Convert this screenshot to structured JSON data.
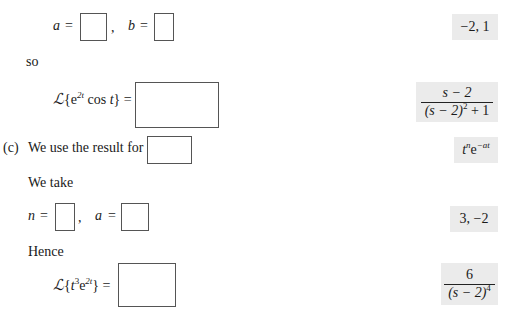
{
  "rows": {
    "ab": {
      "a_label": "a",
      "b_label": "b",
      "eq": "=",
      "comma": ",",
      "answer": "−2, 1"
    },
    "so": {
      "text": "so"
    },
    "laplace_cos": {
      "L": "ℒ",
      "open": "{e",
      "exp": "2t",
      "mid": " cos ",
      "t": "t",
      "close": "} =",
      "answer_num": "s − 2",
      "answer_den_base": "(s − 2)",
      "answer_den_exp": "2",
      "answer_den_tail": " + 1"
    },
    "part_c": {
      "label": "(c)",
      "text": "We use the result for",
      "answer_t": "t",
      "answer_n": "n",
      "answer_e": "e",
      "answer_exp": "−at"
    },
    "we_take": {
      "text": "We take"
    },
    "na": {
      "n_label": "n",
      "a_label": "a",
      "eq": "=",
      "comma": ",",
      "answer": "3, −2"
    },
    "hence": {
      "text": "Hence"
    },
    "laplace_t3": {
      "L": "ℒ",
      "open": "{",
      "t": "t",
      "t_exp": "3",
      "e": "e",
      "e_exp": "2t",
      "close": "} =",
      "answer_num": "6",
      "answer_den_base": "(s − 2)",
      "answer_den_exp": "4"
    }
  }
}
